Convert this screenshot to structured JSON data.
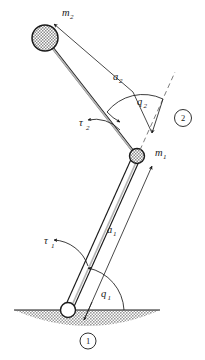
{
  "figure": {
    "type": "two-link-planar-manipulator-diagram",
    "background_color": "#ffffff",
    "line_color": "#1a1a1a",
    "hatch_color": "#9a9a9a",
    "ground_fill": "#a8a8a8"
  },
  "labels": {
    "mass_2": {
      "base": "m",
      "sub": "2"
    },
    "mass_1": {
      "base": "m",
      "sub": "1"
    },
    "link_length_2": {
      "base": "a",
      "sub": "2"
    },
    "link_length_1": {
      "base": "a",
      "sub": "1"
    },
    "joint_angle_2": {
      "base": "q",
      "sub": "2"
    },
    "joint_angle_1": {
      "base": "q",
      "sub": "1"
    },
    "torque_2": {
      "base": "τ",
      "sub": "2"
    },
    "torque_1": {
      "base": "τ",
      "sub": "1"
    },
    "frame_marker_2": "2",
    "frame_marker_1": "1"
  },
  "geometry": {
    "base_joint": {
      "x": 68,
      "y": 310,
      "r": 7.5
    },
    "elbow_joint": {
      "x": 137,
      "y": 156,
      "r": 7.5
    },
    "end_mass": {
      "x": 45,
      "y": 38,
      "r": 13
    },
    "ground_line": {
      "x1": 14,
      "y1": 310,
      "x2": 160,
      "y2": 310
    },
    "link1_angle_deg": 66,
    "link2_angle_deg": 119
  }
}
